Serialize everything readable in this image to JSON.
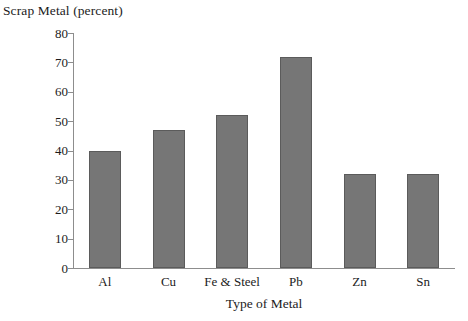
{
  "chart_data": {
    "type": "bar",
    "title": "Scrap Metal (percent)",
    "xlabel": "Type of Metal",
    "ylabel": "",
    "categories": [
      "Al",
      "Cu",
      "Fe & Steel",
      "Pb",
      "Zn",
      "Sn"
    ],
    "values": [
      40,
      47,
      52,
      72,
      32,
      32
    ],
    "ylim": [
      0,
      80
    ],
    "yticks": [
      0,
      10,
      20,
      30,
      40,
      50,
      60,
      70,
      80
    ],
    "ytick_labels": [
      "0",
      "10",
      "20",
      "30",
      "40",
      "50",
      "60",
      "70",
      "80"
    ],
    "grid": false,
    "legend": "none",
    "bar_color": "#767676",
    "bar_edge_color": "#5b5b5b",
    "axis_color": "#8d8d8d",
    "text_color": "#1c1c1c",
    "background": "#ffffff"
  }
}
